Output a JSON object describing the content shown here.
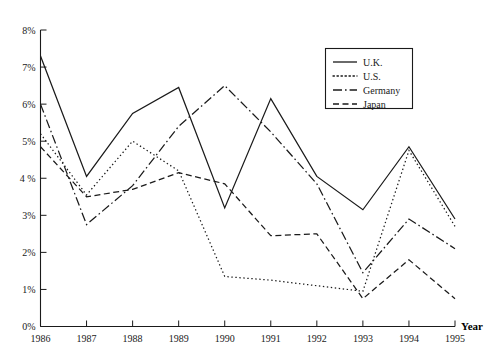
{
  "chart_data": {
    "type": "line",
    "title": "",
    "xlabel": "Year",
    "ylabel": "",
    "x": [
      1986,
      1987,
      1988,
      1989,
      1990,
      1991,
      1992,
      1993,
      1994,
      1995
    ],
    "categories": [
      "1986",
      "1987",
      "1988",
      "1989",
      "1990",
      "1991",
      "1992",
      "1993",
      "1994",
      "1995"
    ],
    "xlim": [
      1986,
      1995
    ],
    "ylim": [
      0,
      8
    ],
    "y_tick_labels": [
      "0%",
      "1%",
      "2%",
      "3%",
      "4 %",
      "5%",
      "6%",
      "7%",
      "8%"
    ],
    "y_tick_values": [
      0,
      1,
      2,
      3,
      4,
      5,
      6,
      7,
      8
    ],
    "grid": false,
    "legend_position": "upper-right",
    "series": [
      {
        "name": "U.K.",
        "style": "solid",
        "values": [
          7.3,
          4.05,
          5.75,
          6.45,
          3.2,
          6.15,
          4.05,
          3.15,
          4.85,
          2.9
        ]
      },
      {
        "name": "U.S.",
        "style": "dotted",
        "values": [
          5.2,
          3.55,
          5.0,
          4.2,
          1.35,
          1.25,
          1.1,
          0.95,
          4.75,
          2.7
        ]
      },
      {
        "name": "Germany",
        "style": "dash-dot",
        "values": [
          6.0,
          2.75,
          3.8,
          5.4,
          6.5,
          5.25,
          3.85,
          1.45,
          2.9,
          2.1
        ]
      },
      {
        "name": "Japan",
        "style": "dashed",
        "values": [
          4.85,
          3.5,
          3.7,
          4.15,
          3.85,
          2.45,
          2.5,
          0.75,
          1.8,
          0.75
        ]
      }
    ]
  },
  "legend": {
    "entries": [
      {
        "label": "U.K."
      },
      {
        "label": "U.S."
      },
      {
        "label": "Germany"
      },
      {
        "label": "Japan"
      }
    ]
  },
  "axes": {
    "x_title": "Year"
  },
  "colors": {
    "ink": "#1a1a1a",
    "background": "#ffffff"
  }
}
